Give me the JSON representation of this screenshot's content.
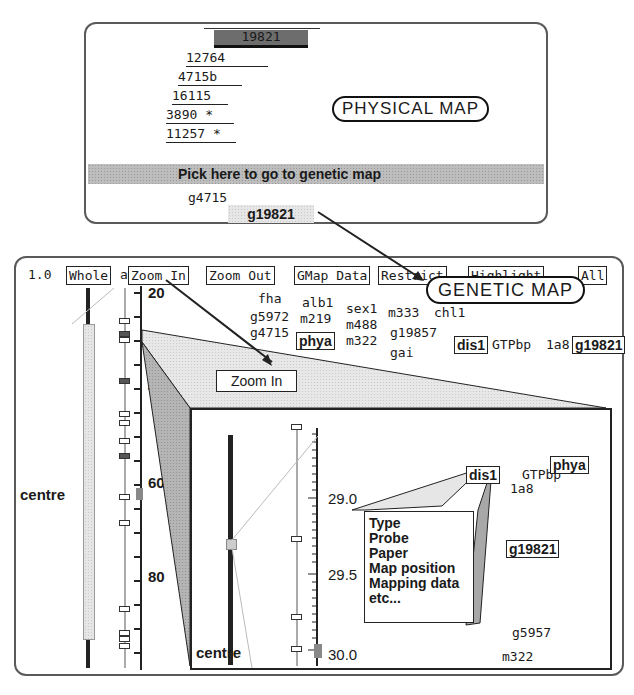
{
  "physical_map": {
    "title": "PHYSICAL MAP",
    "clones": [
      {
        "label": "19821",
        "selected": true
      },
      {
        "label": "12764",
        "selected": false
      },
      {
        "label": "4715b",
        "selected": false
      },
      {
        "label": "16115",
        "selected": false
      },
      {
        "label": "3890 *",
        "selected": false
      },
      {
        "label": "11257 *",
        "selected": false
      }
    ],
    "pick_bar": "Pick  here to go to genetic map",
    "markers": [
      "g4715",
      "g19821"
    ]
  },
  "genetic_map": {
    "title": "GENETIC MAP",
    "scale_label": "1.0",
    "toolbar": {
      "whole": "Whole",
      "a": "a",
      "zoom_in": "Zoom In",
      "zoom_out": "Zoom Out",
      "gmap_data": "GMap Data",
      "restrict": "Restrict",
      "highlight": "Highlight",
      "all": "All"
    },
    "axis_labels": [
      "20",
      "40",
      "60",
      "80"
    ],
    "centre_label": "centre",
    "markers": {
      "fha": "fha",
      "alb1": "alb1",
      "sex1": "sex1",
      "m333": "m333",
      "chl1": "chl1",
      "g5972": "g5972",
      "m219": "m219",
      "m488": "m488",
      "g19857": "g19857",
      "g4715": "g4715",
      "phya": "phya",
      "m322": "m322",
      "dis1": "dis1",
      "GTPbp": "GTPbp",
      "1a8": "1a8",
      "g19821": "g19821",
      "gai": "gai"
    },
    "zoom_in_callout": "Zoom In",
    "inset": {
      "axis_labels": [
        "29.0",
        "29.5",
        "30.0"
      ],
      "centre_label": "centre",
      "markers": {
        "dis1": "dis1",
        "GTPbp": "GTPbp",
        "1a8": "1a8",
        "phya": "phya",
        "g19821": "g19821",
        "g5957": "g5957",
        "m322": "m322"
      },
      "popup_items": [
        "Type",
        "Probe",
        "Paper",
        "Map position",
        "Mapping data",
        "etc..."
      ]
    }
  }
}
